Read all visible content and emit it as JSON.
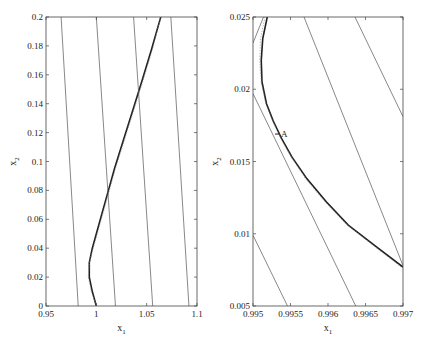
{
  "chart_data": [
    {
      "type": "line",
      "panel": "left",
      "xlabel": "x1",
      "ylabel": "x2",
      "xlim": [
        0.95,
        1.1
      ],
      "ylim": [
        0,
        0.2
      ],
      "xticks": [
        0.95,
        1,
        1.05,
        1.1
      ],
      "xtick_labels": [
        "0.95",
        "1",
        "1.05",
        "1.1"
      ],
      "yticks": [
        0,
        0.02,
        0.04,
        0.06,
        0.08,
        0.1,
        0.12,
        0.14,
        0.16,
        0.18,
        0.2
      ],
      "ytick_labels": [
        "0",
        "0.02",
        "0.04",
        "0.06",
        "0.08",
        "0.1",
        "0.12",
        "0.14",
        "0.16",
        "0.18",
        "0.2"
      ],
      "grid": false,
      "series": [
        {
          "name": "trajectory",
          "style": "thick",
          "x": [
            1.0,
            0.996,
            0.993,
            0.993,
            0.996,
            1.002,
            1.01,
            1.018,
            1.027,
            1.036,
            1.045,
            1.055,
            1.064
          ],
          "y": [
            0,
            0.01,
            0.02,
            0.03,
            0.04,
            0.055,
            0.075,
            0.095,
            0.115,
            0.135,
            0.155,
            0.178,
            0.2
          ]
        },
        {
          "name": "dotted-approx",
          "style": "dotted",
          "x": [
            1.0,
            0.995,
            0.992,
            0.993,
            0.997,
            1.003,
            1.011,
            1.019,
            1.028,
            1.037,
            1.046,
            1.056,
            1.064
          ],
          "y": [
            0,
            0.01,
            0.02,
            0.03,
            0.04,
            0.055,
            0.075,
            0.095,
            0.115,
            0.135,
            0.155,
            0.178,
            0.2
          ]
        },
        {
          "name": "line-1",
          "style": "thin",
          "x": [
            0.965,
            0.982
          ],
          "y": [
            0.2,
            0
          ]
        },
        {
          "name": "line-2",
          "style": "thin",
          "x": [
            1.0,
            1.019
          ],
          "y": [
            0.2,
            0
          ]
        },
        {
          "name": "line-3",
          "style": "thin",
          "x": [
            1.037,
            1.056
          ],
          "y": [
            0.2,
            0
          ]
        },
        {
          "name": "line-4",
          "style": "thin",
          "x": [
            1.074,
            1.092
          ],
          "y": [
            0.2,
            0
          ]
        }
      ]
    },
    {
      "type": "line",
      "panel": "right",
      "xlabel": "x1",
      "ylabel": "x2",
      "xlim": [
        0.995,
        0.997
      ],
      "ylim": [
        0.005,
        0.025
      ],
      "xticks": [
        0.995,
        0.9955,
        0.996,
        0.9965,
        0.997
      ],
      "xtick_labels": [
        "0.995",
        "0.9955",
        "0.996",
        "0.9965",
        "0.997"
      ],
      "yticks": [
        0.005,
        0.01,
        0.015,
        0.02,
        0.025
      ],
      "ytick_labels": [
        "0.005",
        "0.01",
        "0.015",
        "0.02",
        "0.025"
      ],
      "grid": false,
      "annotations": [
        {
          "text": "A",
          "x": 0.99532,
          "y": 0.0169
        }
      ],
      "series": [
        {
          "name": "trajectory",
          "style": "thick",
          "x": [
            0.99519,
            0.99513,
            0.99511,
            0.99512,
            0.99518,
            0.99527,
            0.99538,
            0.99552,
            0.99572,
            0.99598,
            0.99627,
            0.99662,
            0.997
          ],
          "y": [
            0.025,
            0.0235,
            0.022,
            0.0205,
            0.019,
            0.0178,
            0.0166,
            0.0153,
            0.0138,
            0.0122,
            0.0106,
            0.0092,
            0.0077
          ]
        },
        {
          "name": "dotted-approx",
          "style": "dotted",
          "x": [
            0.99516,
            0.9951,
            0.99509,
            0.99511,
            0.99517,
            0.99526,
            0.99537,
            0.99551,
            0.9957,
            0.99596,
            0.99626,
            0.9966,
            0.997
          ],
          "y": [
            0.025,
            0.0235,
            0.022,
            0.0205,
            0.019,
            0.0178,
            0.0166,
            0.0153,
            0.0138,
            0.0122,
            0.0106,
            0.0092,
            0.0076
          ]
        },
        {
          "name": "line-1",
          "style": "thin",
          "x": [
            0.995,
            0.99546
          ],
          "y": [
            0.0099,
            0.005
          ]
        },
        {
          "name": "line-2",
          "style": "thin",
          "x": [
            0.995,
            0.99637
          ],
          "y": [
            0.0197,
            0.005
          ]
        },
        {
          "name": "line-3",
          "style": "thin",
          "x": [
            0.99514,
            0.995
          ],
          "y": [
            0.025,
            0.0232
          ]
        },
        {
          "name": "line-4",
          "style": "thin",
          "x": [
            0.99568,
            0.997
          ],
          "y": [
            0.025,
            0.0078
          ]
        },
        {
          "name": "line-5",
          "style": "thin",
          "x": [
            0.99636,
            0.997
          ],
          "y": [
            0.025,
            0.0181
          ]
        }
      ]
    }
  ],
  "panels": {
    "left": {
      "xlabel_text": "x",
      "xlabel_sub": "1",
      "ylabel_text": "x",
      "ylabel_sub": "2"
    },
    "right": {
      "xlabel_text": "x",
      "xlabel_sub": "1",
      "ylabel_text": "x",
      "ylabel_sub": "2"
    }
  }
}
